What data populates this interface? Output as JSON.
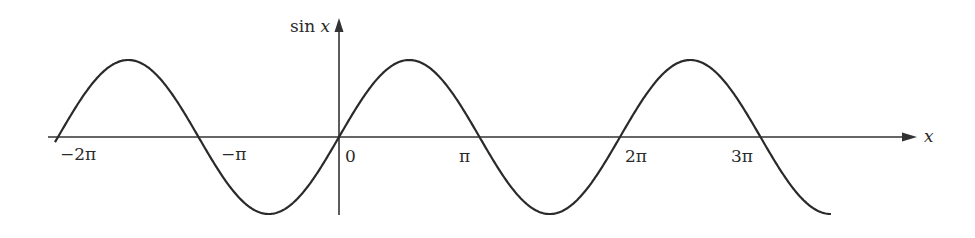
{
  "chart_data": {
    "type": "line",
    "title": "",
    "function": "sin x",
    "xlabel": "x",
    "ylabel": "sin x",
    "x_tick_labels": [
      "−2π",
      "−π",
      "0",
      "π",
      "2π",
      "3π"
    ],
    "x_tick_values": [
      -6.2832,
      -3.1416,
      0,
      3.1416,
      6.2832,
      9.4248
    ],
    "xlim": [
      -6.4,
      11.0
    ],
    "ylim": [
      -1.0,
      1.0
    ],
    "grid": false,
    "legend": null,
    "series": [
      {
        "name": "sin x",
        "x_start": -6.35,
        "x_end": 11.0,
        "key_points": [
          {
            "x": -6.2832,
            "y": 0
          },
          {
            "x": -4.7124,
            "y": 1
          },
          {
            "x": -3.1416,
            "y": 0
          },
          {
            "x": -1.5708,
            "y": -1
          },
          {
            "x": 0,
            "y": 0
          },
          {
            "x": 1.5708,
            "y": 1
          },
          {
            "x": 3.1416,
            "y": 0
          },
          {
            "x": 4.7124,
            "y": -1
          },
          {
            "x": 6.2832,
            "y": 0
          },
          {
            "x": 7.854,
            "y": 1
          },
          {
            "x": 9.4248,
            "y": 0
          },
          {
            "x": 10.9956,
            "y": -1
          }
        ]
      }
    ],
    "colors": {
      "curve": "#2a2a2a",
      "axes": "#333333",
      "background": "#ffffff"
    }
  },
  "labels": {
    "y_axis": "sin x",
    "x_axis": "x",
    "ticks": [
      "−2π",
      "−π",
      "0",
      "π",
      "2π",
      "3π"
    ]
  }
}
